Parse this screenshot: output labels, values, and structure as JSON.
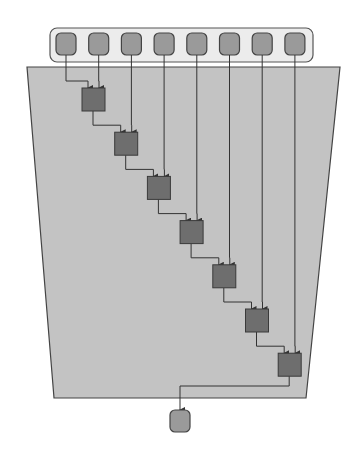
{
  "diagram": {
    "colors": {
      "background": "#ffffff",
      "container_fill": "#c3c3c3",
      "container_stroke": "#444444",
      "input_bar_fill": "#ececec",
      "input_bar_stroke": "#555555",
      "input_node_fill": "#9a9a9a",
      "op_node_fill": "#6e6e6e",
      "output_node_fill": "#9a9a9a",
      "edge": "#333333"
    },
    "inputs": [
      {
        "id": "in-1"
      },
      {
        "id": "in-2"
      },
      {
        "id": "in-3"
      },
      {
        "id": "in-4"
      },
      {
        "id": "in-5"
      },
      {
        "id": "in-6"
      },
      {
        "id": "in-7"
      },
      {
        "id": "in-8"
      }
    ],
    "operations": [
      {
        "id": "op-1"
      },
      {
        "id": "op-2"
      },
      {
        "id": "op-3"
      },
      {
        "id": "op-4"
      },
      {
        "id": "op-5"
      },
      {
        "id": "op-6"
      },
      {
        "id": "op-7"
      }
    ],
    "output": {
      "id": "out-1"
    }
  }
}
